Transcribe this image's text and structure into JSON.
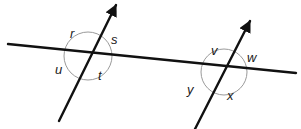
{
  "figure": {
    "type": "geometry-diagram",
    "background_color": "#ffffff",
    "line_color": "#111111",
    "arc_color": "#9a9a9a",
    "label_color": "#1a1a1a"
  },
  "lines": [
    {
      "name": "transversal-line",
      "kind": "segment",
      "arrowheads": "none",
      "start": {
        "x": 8,
        "y": 44
      },
      "end": {
        "x": 296,
        "y": 73
      }
    },
    {
      "name": "left-parallel-ray",
      "kind": "ray",
      "arrowheads": "end",
      "start": {
        "x": 59,
        "y": 121
      },
      "end": {
        "x": 116,
        "y": 5
      }
    },
    {
      "name": "right-parallel-ray",
      "kind": "ray",
      "arrowheads": "end",
      "start": {
        "x": 195,
        "y": 129
      },
      "end": {
        "x": 250,
        "y": 21
      }
    }
  ],
  "intersections": [
    {
      "name": "left-intersection",
      "center": {
        "x": 88,
        "y": 56
      },
      "arc_radius": 24
    },
    {
      "name": "right-intersection",
      "center": {
        "x": 224,
        "y": 72
      },
      "arc_radius": 23
    }
  ],
  "angle_labels": [
    {
      "id": "r",
      "text": "r",
      "x": 70,
      "y": 27
    },
    {
      "id": "s",
      "text": "s",
      "x": 111,
      "y": 33
    },
    {
      "id": "u",
      "text": "u",
      "x": 55,
      "y": 63
    },
    {
      "id": "t",
      "text": "t",
      "x": 98,
      "y": 69
    },
    {
      "id": "v",
      "text": "v",
      "x": 211,
      "y": 44
    },
    {
      "id": "w",
      "text": "w",
      "x": 247,
      "y": 51
    },
    {
      "id": "y",
      "text": "y",
      "x": 187,
      "y": 83
    },
    {
      "id": "x",
      "text": "x",
      "x": 227,
      "y": 89
    }
  ]
}
